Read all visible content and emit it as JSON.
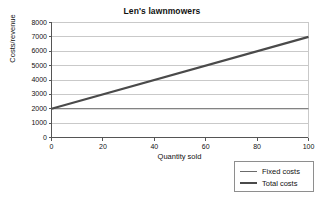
{
  "chart_data": {
    "type": "line",
    "title": "Len's lawnmowers",
    "xlabel": "Quantity sold",
    "ylabel": "Costs/revenue",
    "xlim": [
      0,
      100
    ],
    "ylim": [
      0,
      8000
    ],
    "grid": true,
    "legend_position": "outside-bottom-right",
    "x": [
      0,
      100
    ],
    "xticks": [
      "0",
      "20",
      "40",
      "60",
      "80",
      "100"
    ],
    "xtick_values": [
      0,
      20,
      40,
      60,
      80,
      100
    ],
    "yticks": [
      "0",
      "1000",
      "2000",
      "3000",
      "4000",
      "5000",
      "6000",
      "7000",
      "8000"
    ],
    "ytick_values": [
      0,
      1000,
      2000,
      3000,
      4000,
      5000,
      6000,
      7000,
      8000
    ],
    "series": [
      {
        "name": "Fixed costs",
        "values": [
          2000,
          2000
        ],
        "color": "#6b6b6b",
        "width": 1.2
      },
      {
        "name": "Total costs",
        "values": [
          2000,
          7000
        ],
        "color": "#4a4a4a",
        "width": 2.1
      }
    ]
  },
  "legend": {
    "items": [
      {
        "label": "Fixed costs"
      },
      {
        "label": "Total costs"
      }
    ]
  },
  "colors": {
    "background": "#ffffff",
    "gridline": "#c9c9c9",
    "axis": "#555555",
    "text": "#111111"
  }
}
